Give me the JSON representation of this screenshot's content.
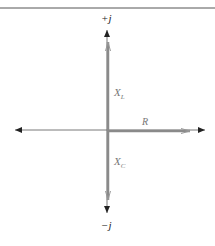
{
  "diagram": {
    "axis_labels": {
      "positive_imaginary": "+j",
      "negative_imaginary": "−j"
    },
    "vectors": [
      {
        "name": "X",
        "subscript": "L",
        "direction": "up"
      },
      {
        "name": "R",
        "subscript": "",
        "direction": "right"
      },
      {
        "name": "X",
        "subscript": "C",
        "direction": "down"
      }
    ],
    "colors": {
      "axis": "#333333",
      "vector": "#8a8a8a",
      "label": "#777777",
      "rule": "#555555"
    }
  }
}
